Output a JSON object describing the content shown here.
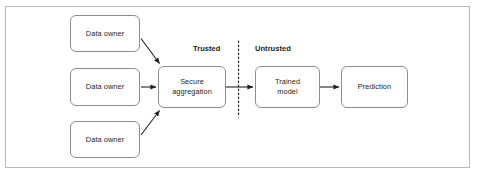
{
  "figure": {
    "background_color": "#ffffff",
    "border_color": "#b9b9b9",
    "node_border_color": "#8d8d8d",
    "text_color": "#231f20",
    "arrow_color": "#231f20",
    "divider_color": "#231f20"
  },
  "zones": {
    "trusted_label": "Trusted",
    "untrusted_label": "Untrusted"
  },
  "nodes": [
    {
      "id": "data-owner-1",
      "label": "Data owner"
    },
    {
      "id": "data-owner-2",
      "label": "Data owner"
    },
    {
      "id": "data-owner-3",
      "label": "Data owner"
    },
    {
      "id": "secure-aggregation",
      "label": "Secure\naggregation"
    },
    {
      "id": "trained-model",
      "label": "Trained\nmodel"
    },
    {
      "id": "prediction",
      "label": "Prediction"
    }
  ],
  "edges": [
    {
      "from": "data-owner-1",
      "to": "secure-aggregation",
      "style": "diagonal-down-right"
    },
    {
      "from": "data-owner-2",
      "to": "secure-aggregation",
      "style": "horizontal"
    },
    {
      "from": "data-owner-3",
      "to": "secure-aggregation",
      "style": "diagonal-up-right"
    },
    {
      "from": "secure-aggregation",
      "to": "trained-model",
      "style": "horizontal"
    },
    {
      "from": "trained-model",
      "to": "prediction",
      "style": "horizontal"
    }
  ]
}
